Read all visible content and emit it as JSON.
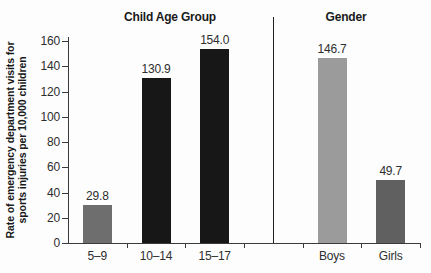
{
  "page": {
    "background": "#fdfdfd"
  },
  "chart_data": {
    "type": "bar",
    "title": "",
    "ylabel_lines": [
      "Rate of emergency department visits for",
      "sports injuries per 10,000 children"
    ],
    "ylim": [
      0,
      160
    ],
    "yticks": [
      0,
      20,
      40,
      60,
      80,
      100,
      120,
      140,
      160
    ],
    "x_slot_count": 6,
    "grid": "off",
    "legend": "none",
    "axis_color": "#3a3a3a",
    "separator_color": "#222222",
    "text_color": "#2e2e2e",
    "groups": [
      {
        "label": "Child Age Group",
        "slots": [
          0,
          1,
          2
        ],
        "bars": [
          {
            "category": "5–9",
            "value": 29.8,
            "display": "29.8",
            "color": "#6e6e6e"
          },
          {
            "category": "10–14",
            "value": 130.9,
            "display": "130.9",
            "color": "#171717"
          },
          {
            "category": "15–17",
            "value": 154.0,
            "display": "154.0",
            "color": "#171717"
          }
        ]
      },
      {
        "label": "Gender",
        "slots": [
          4,
          5
        ],
        "bars": [
          {
            "category": "Boys",
            "value": 146.7,
            "display": "146.7",
            "color": "#9b9b9b"
          },
          {
            "category": "Girls",
            "value": 49.7,
            "display": "49.7",
            "color": "#606060"
          }
        ]
      }
    ]
  }
}
